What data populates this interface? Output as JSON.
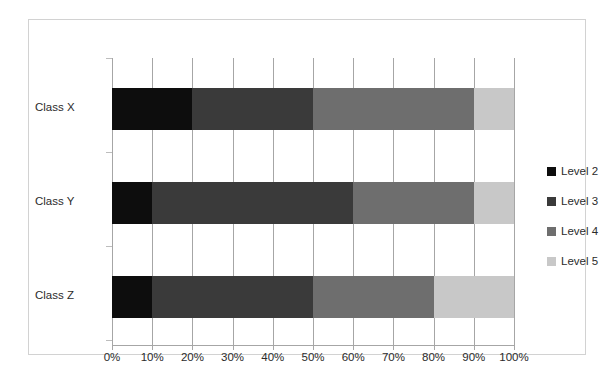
{
  "chart_data": {
    "type": "bar",
    "subtype": "100% stacked horizontal bar",
    "title": "",
    "xlabel": "",
    "ylabel": "",
    "categories": [
      "Class X",
      "Class Y",
      "Class Z"
    ],
    "series": [
      {
        "name": "Level 2",
        "color": "#0d0d0d",
        "values": [
          20,
          10,
          10
        ]
      },
      {
        "name": "Level 3",
        "color": "#3a3a3a",
        "values": [
          30,
          50,
          40
        ]
      },
      {
        "name": "Level 4",
        "color": "#6e6e6e",
        "values": [
          40,
          30,
          30
        ]
      },
      {
        "name": "Level 5",
        "color": "#c8c8c8",
        "values": [
          10,
          10,
          20
        ]
      }
    ],
    "xlim": [
      0,
      100
    ],
    "xticks": [
      0,
      10,
      20,
      30,
      40,
      50,
      60,
      70,
      80,
      90,
      100
    ],
    "xticklabels": [
      "0%",
      "10%",
      "20%",
      "30%",
      "40%",
      "50%",
      "60%",
      "70%",
      "80%",
      "90%",
      "100%"
    ],
    "grid": "vertical",
    "legend_position": "right",
    "plot_background": "#ffffff",
    "gridline_color": "#a6a6a6",
    "border_color": "#d2d2d2"
  },
  "legend": {
    "items": [
      {
        "label": "Level 2",
        "color": "#0d0d0d"
      },
      {
        "label": "Level 3",
        "color": "#3a3a3a"
      },
      {
        "label": "Level 4",
        "color": "#6e6e6e"
      },
      {
        "label": "Level 5",
        "color": "#c8c8c8"
      }
    ]
  },
  "axis": {
    "x_tick_labels": [
      "0%",
      "10%",
      "20%",
      "30%",
      "40%",
      "50%",
      "60%",
      "70%",
      "80%",
      "90%",
      "100%"
    ],
    "y_tick_labels": [
      "Class X",
      "Class Y",
      "Class Z"
    ]
  }
}
